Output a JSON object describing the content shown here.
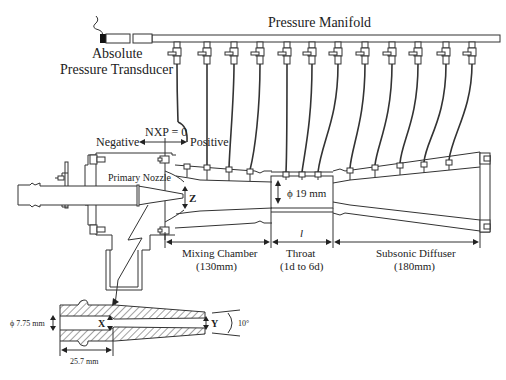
{
  "labels": {
    "pressure_manifold": "Pressure Manifold",
    "transducer_line1": "Absolute",
    "transducer_line2": "Pressure Transducer",
    "nxp_zero": "NXP = 0",
    "negative": "Negative",
    "positive": "Positive",
    "primary_nozzle": "Primary Nozzle",
    "z": "Z",
    "throat_diameter": "ϕ 19 mm",
    "length_symbol": "l",
    "mixing_chamber": "Mixing Chamber",
    "mixing_chamber_len": "(130mm)",
    "throat": "Throat",
    "throat_len": "(1d to 6d)",
    "subsonic_diffuser": "Subsonic Diffuser",
    "subsonic_diffuser_len": "(180mm)",
    "nozzle_inlet_diameter": "ϕ 7.75 mm",
    "x": "X",
    "y": "Y",
    "angle": "10°",
    "nozzle_length": "25.7 mm"
  },
  "pressure_taps": {
    "count": 12,
    "valve_x": [
      176,
      206,
      233,
      260,
      290,
      318,
      346,
      374,
      402,
      430,
      459,
      486
    ],
    "tap_x": [
      180,
      204,
      228,
      252,
      283,
      302,
      318,
      350,
      375,
      400,
      424,
      449
    ]
  },
  "colors": {
    "line": "#333333",
    "background": "#ffffff",
    "transducer_fill": "#111111"
  }
}
